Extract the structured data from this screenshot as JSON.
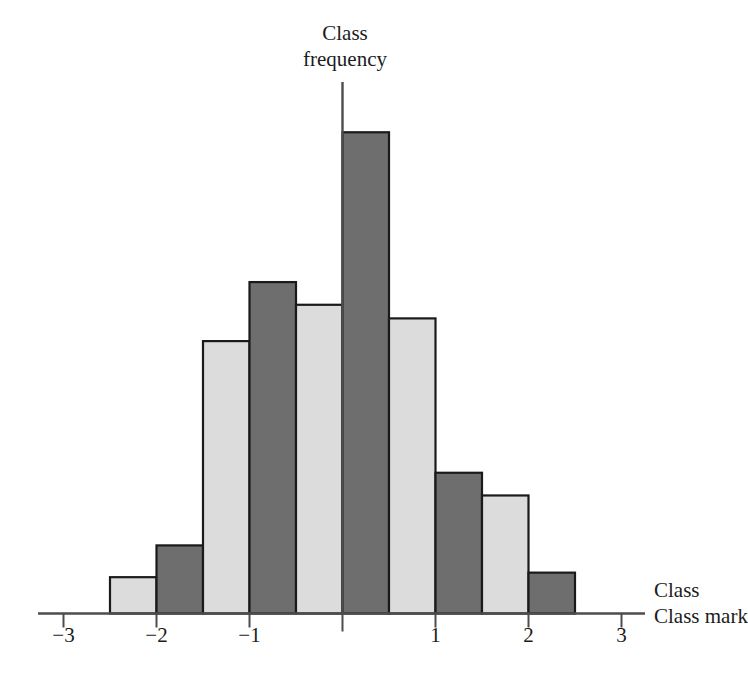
{
  "chart_data": {
    "type": "bar",
    "title": "",
    "subtitle": "",
    "xlabel": "Class mark",
    "ylabel": "Class frequency",
    "grid": false,
    "legend": null,
    "xlim": [
      -3.5,
      3.5
    ],
    "ylim": [
      0,
      11
    ],
    "xticks": [
      -3,
      -2,
      -1,
      1,
      2,
      3
    ],
    "xtick_labels": [
      "−3",
      "−2",
      "−1",
      "1",
      "2",
      "3"
    ],
    "bin_width": 0.5,
    "bin_edges": [
      -2.5,
      -2.0,
      -1.5,
      -1.0,
      -0.5,
      0.0,
      0.5,
      1.0,
      1.5,
      2.0,
      2.5
    ],
    "categories": [
      "-2.25",
      "-1.75",
      "-1.25",
      "-0.75",
      "-0.25",
      "0.25",
      "0.75",
      "1.25",
      "1.75",
      "2.25"
    ],
    "values": [
      0.8,
      1.5,
      6.0,
      7.3,
      6.8,
      10.6,
      6.5,
      3.1,
      2.6,
      0.9
    ],
    "bar_fill_alternating": [
      "light",
      "dark",
      "light",
      "dark",
      "light",
      "dark",
      "light",
      "dark",
      "light",
      "dark"
    ],
    "annotations": []
  },
  "axes": {
    "x_axis_label": "Class mark",
    "y_axis_label_line1": "Class",
    "y_axis_label_line2": "frequency",
    "tick_labels": [
      "−3",
      "−2",
      "−1",
      "1",
      "2",
      "3"
    ]
  },
  "colors": {
    "bar_light": "#dcdcdc",
    "bar_dark": "#6e6e6e",
    "bar_outline": "#1a1a1a",
    "axis": "#4d4d4d",
    "text": "#1c1c1c",
    "background": "#ffffff"
  }
}
